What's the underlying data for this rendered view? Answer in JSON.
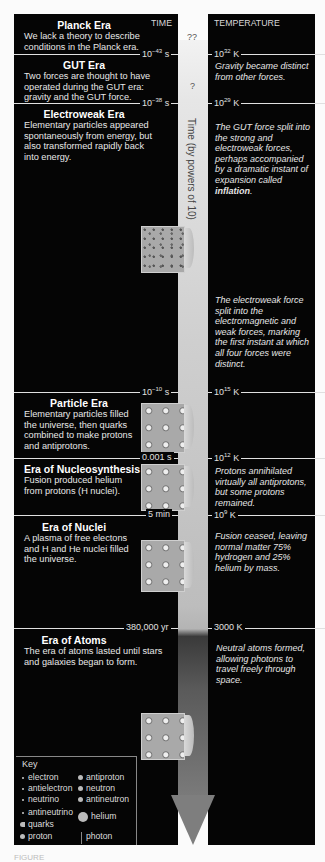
{
  "headers": {
    "time": "TIME",
    "temperature": "TEMPERATURE"
  },
  "axis_label": "Time (by powers of 10)",
  "unknowns": {
    "planck": "??",
    "gut": "?"
  },
  "eras": [
    {
      "title": "Planck Era",
      "description": "We lack a theory to describe conditions in the Planck era."
    },
    {
      "title": "GUT Era",
      "description": "Two forces are thought to have operated during the GUT era: gravity and the GUT force."
    },
    {
      "title": "Electroweak Era",
      "description": "Elementary particles appeared spontaneously from energy, but also transformed rapidly back into energy."
    },
    {
      "title": "Particle Era",
      "description": "Elementary particles filled the universe, then quarks combined to make protons and antiprotons."
    },
    {
      "title": "Era of Nucleosynthesis",
      "description": "Fusion produced helium from protons (H nuclei)."
    },
    {
      "title": "Era of Nuclei",
      "description": "A plasma of free electons and H and He nuclei filled the universe."
    },
    {
      "title": "Era of Atoms",
      "description": "The era of atoms lasted until stars and galaxies began to form."
    }
  ],
  "boundaries": [
    {
      "time_base": "10",
      "time_exp": "−43",
      "time_unit": " s",
      "temp_base": "10",
      "temp_exp": "32",
      "temp_unit": " K",
      "note": "Gravity became distinct from other forces."
    },
    {
      "time_base": "10",
      "time_exp": "−38",
      "time_unit": " s",
      "temp_base": "10",
      "temp_exp": "29",
      "temp_unit": " K",
      "note_pre": "The GUT force split into the strong and electroweak forces, perhaps accompanied by a dramatic instant of expansion called ",
      "note_bold": "inflation",
      "note_post": "."
    },
    {
      "time_base": "10",
      "time_exp": "−10",
      "time_unit": " s",
      "temp_base": "10",
      "temp_exp": "15",
      "temp_unit": " K",
      "note": "The electroweak force split into the electromagnetic and weak forces, marking the first instant at which all four forces were distinct."
    },
    {
      "time": "0.001 s",
      "temp_base": "10",
      "temp_exp": "12",
      "temp_unit": " K",
      "note": "Protons annihilated virtually all antiprotons, but some protons remained."
    },
    {
      "time": "5 min",
      "temp_base": "10",
      "temp_exp": "9",
      "temp_unit": " K",
      "note": "Fusion ceased, leaving normal matter 75% hydrogen and 25% helium by mass."
    },
    {
      "time": "380,000 yr",
      "temp": "3000 K",
      "note": "Neutral atoms formed, allowing photons to travel freely through space."
    }
  ],
  "key": {
    "title": "Key",
    "items": [
      "electron",
      "antielectron",
      "neutrino",
      "antineutrino",
      "quarks",
      "proton",
      "antiproton",
      "neutron",
      "antineutron",
      "helium",
      "photon"
    ]
  },
  "caption": "FIGURE"
}
